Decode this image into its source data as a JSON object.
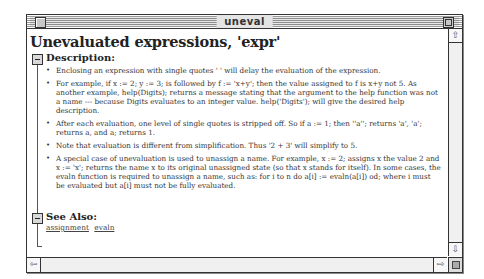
{
  "window": {
    "title": "uneval"
  },
  "page": {
    "heading": "Unevaluated expressions, 'expr'"
  },
  "sections": {
    "description": {
      "label": "Description:",
      "items": [
        "Enclosing an expression with single quotes ' ' will delay the evaluation of the expression.",
        "For example, if x := 2; y := 3; is followed by f := 'x+y'; then the value assigned to f is x+y not 5. As another example, help(Digits); returns a message stating that the argument to the help function was not a name --- because Digits evaluates to an integer value. help('Digits'); will give the desired help description.",
        "After each evaluation, one level of single quotes is stripped off. So if a := 1; then ''a''; returns 'a', 'a'; returns a, and a; returns 1.",
        "Note that evaluation is different from simplification. Thus '2 + 3' will simplify to 5.",
        "A special case of unevaluation is used to unassign a name. For example, x := 2; assigns x the value 2 and x := 'x'; returns the name x to its original unassigned state (so that x stands for itself). In some cases, the evaln function is required to unassign a name, such as: for i to n do a[i] := evaln(a[i]) od; where i must be evaluated but a[i] must not be fully evaluated."
      ]
    },
    "see_also": {
      "label": "See Also:",
      "links": [
        "assignment",
        "evaln"
      ]
    }
  },
  "scrollbars": {
    "up_arrow": "⇧",
    "down_arrow": "⇩",
    "left_arrow": "⇦",
    "right_arrow": "⇨"
  }
}
